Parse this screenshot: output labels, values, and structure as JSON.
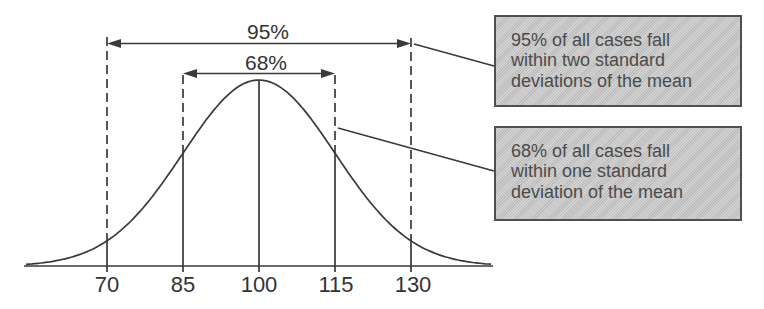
{
  "chart_data": {
    "type": "line",
    "curve": "normal-distribution",
    "title": "",
    "xlabel": "",
    "ylabel": "",
    "mean": 100,
    "standard_deviation": 15,
    "x_ticks": [
      "70",
      "85",
      "100",
      "115",
      "130"
    ],
    "x_tick_values": [
      70,
      85,
      100,
      115,
      130
    ],
    "grid": false,
    "annotations": [
      {
        "label": "95%",
        "from": 70,
        "to": 130,
        "meaning": "two standard deviations around the mean"
      },
      {
        "label": "68%",
        "from": 85,
        "to": 115,
        "meaning": "one standard deviation around the mean"
      }
    ]
  },
  "callouts": [
    {
      "lines": [
        "95% of all cases fall",
        "within two standard",
        "deviations of the mean"
      ]
    },
    {
      "lines": [
        "68% of all cases fall",
        "within one standard",
        "deviation of the mean"
      ]
    }
  ],
  "colors": {
    "line_color": "#3a3a3a",
    "label_color": "#333333",
    "box_fill": "#c5c6c5",
    "box_border": "#4f4f4f",
    "box_text": "#4b4b4b",
    "background": "#ffffff"
  }
}
